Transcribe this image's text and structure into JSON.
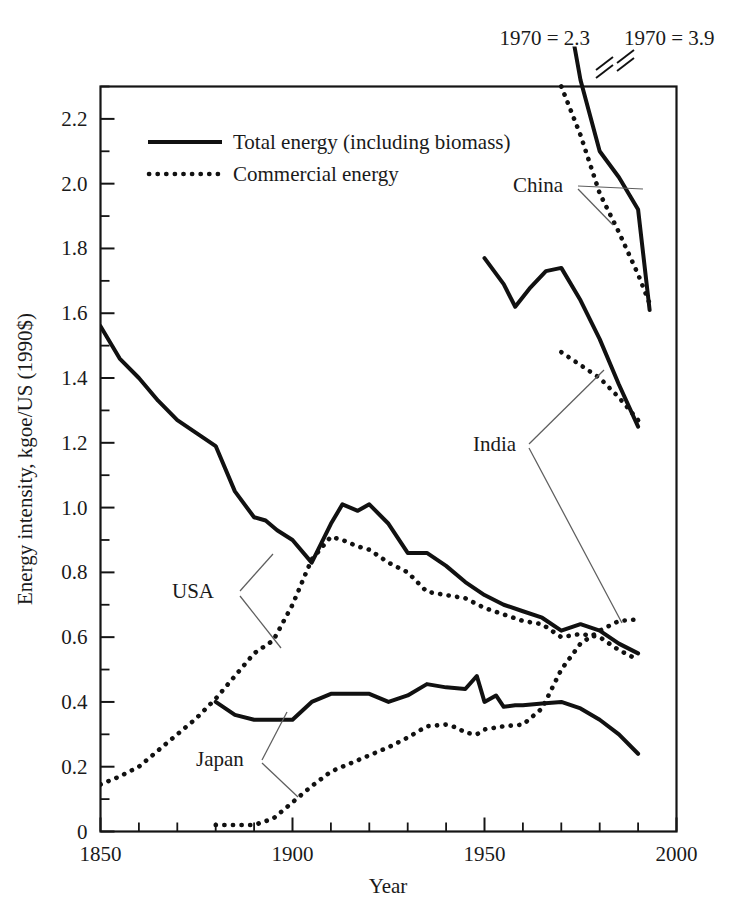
{
  "chart_data": {
    "type": "line",
    "title": "",
    "xlabel": "Year",
    "ylabel": "Energy intensity, kgoe/US (1990$)",
    "xlim": [
      1850,
      2000
    ],
    "ylim": [
      0,
      2.3
    ],
    "xticks": [
      1850,
      1900,
      1950,
      2000
    ],
    "xtick_labels": [
      "1850",
      "1900",
      "1950",
      "2000"
    ],
    "x_minor_step": 10,
    "yticks": [
      0,
      0.2,
      0.4,
      0.6,
      0.8,
      1.0,
      1.2,
      1.4,
      1.6,
      1.8,
      2.0,
      2.2
    ],
    "ytick_labels": [
      "0",
      "0.2",
      "0.4",
      "0.6",
      "0.8",
      "1.0",
      "1.2",
      "1.4",
      "1.6",
      "1.8",
      "2.0",
      "2.2"
    ],
    "y_minor_step": 0.1,
    "grid": false,
    "legend_position": "upper-left-inside",
    "legend": [
      {
        "label": "Total energy (including biomass)",
        "style": "solid"
      },
      {
        "label": "Commercial energy",
        "style": "dotted"
      }
    ],
    "annotations": [
      {
        "text": "1970 = 2.3",
        "series": "China commercial energy",
        "note": "off-scale value above plot, axis break"
      },
      {
        "text": "1970 = 3.9",
        "series": "China total energy",
        "note": "off-scale value above plot, axis break"
      }
    ],
    "country_labels": [
      "USA",
      "Japan",
      "China",
      "India"
    ],
    "series": [
      {
        "name": "USA total energy (including biomass)",
        "country": "USA",
        "style": "solid",
        "x": [
          1850,
          1855,
          1860,
          1865,
          1870,
          1875,
          1880,
          1885,
          1890,
          1893,
          1896,
          1900,
          1905,
          1910,
          1913,
          1917,
          1920,
          1925,
          1930,
          1935,
          1940,
          1945,
          1950,
          1955,
          1960,
          1965,
          1970,
          1975,
          1980,
          1985,
          1990
        ],
        "y": [
          1.56,
          1.46,
          1.4,
          1.33,
          1.27,
          1.23,
          1.19,
          1.05,
          0.97,
          0.96,
          0.93,
          0.9,
          0.83,
          0.95,
          1.01,
          0.99,
          1.01,
          0.95,
          0.86,
          0.86,
          0.82,
          0.77,
          0.73,
          0.7,
          0.68,
          0.66,
          0.62,
          0.64,
          0.62,
          0.58,
          0.55
        ]
      },
      {
        "name": "USA commercial energy",
        "country": "USA",
        "style": "dotted",
        "x": [
          1850,
          1855,
          1860,
          1865,
          1870,
          1875,
          1880,
          1885,
          1890,
          1895,
          1900,
          1905,
          1910,
          1913,
          1917,
          1920,
          1925,
          1930,
          1935,
          1940,
          1945,
          1950,
          1955,
          1960,
          1965,
          1970,
          1975,
          1980,
          1985,
          1990
        ],
        "y": [
          0.145,
          0.17,
          0.2,
          0.25,
          0.3,
          0.35,
          0.41,
          0.48,
          0.55,
          0.59,
          0.7,
          0.84,
          0.91,
          0.9,
          0.88,
          0.87,
          0.83,
          0.8,
          0.74,
          0.73,
          0.72,
          0.69,
          0.67,
          0.65,
          0.64,
          0.6,
          0.61,
          0.6,
          0.56,
          0.53
        ]
      },
      {
        "name": "Japan total energy (including biomass)",
        "country": "Japan",
        "style": "solid",
        "x": [
          1880,
          1885,
          1890,
          1895,
          1900,
          1905,
          1910,
          1915,
          1920,
          1925,
          1930,
          1935,
          1940,
          1945,
          1948,
          1950,
          1953,
          1955,
          1958,
          1960,
          1965,
          1970,
          1975,
          1980,
          1985,
          1990
        ],
        "y": [
          0.4,
          0.36,
          0.345,
          0.345,
          0.345,
          0.4,
          0.425,
          0.425,
          0.425,
          0.4,
          0.42,
          0.455,
          0.445,
          0.44,
          0.48,
          0.4,
          0.42,
          0.385,
          0.39,
          0.39,
          0.395,
          0.4,
          0.38,
          0.345,
          0.3,
          0.24
        ]
      },
      {
        "name": "Japan commercial energy",
        "country": "Japan",
        "style": "dotted",
        "x": [
          1880,
          1885,
          1890,
          1895,
          1900,
          1905,
          1910,
          1915,
          1920,
          1925,
          1930,
          1935,
          1940,
          1943,
          1945,
          1948,
          1950,
          1955,
          1960,
          1965,
          1970,
          1975,
          1980,
          1985,
          1990
        ],
        "y": [
          0.02,
          0.02,
          0.02,
          0.04,
          0.09,
          0.14,
          0.185,
          0.21,
          0.235,
          0.26,
          0.29,
          0.325,
          0.33,
          0.32,
          0.305,
          0.3,
          0.315,
          0.325,
          0.33,
          0.38,
          0.5,
          0.58,
          0.62,
          0.65,
          0.655
        ]
      },
      {
        "name": "India total energy (including biomass)",
        "country": "India",
        "style": "solid",
        "x": [
          1950,
          1955,
          1958,
          1962,
          1966,
          1970,
          1975,
          1980,
          1985,
          1990
        ],
        "y": [
          1.77,
          1.69,
          1.62,
          1.68,
          1.73,
          1.74,
          1.64,
          1.52,
          1.38,
          1.25
        ]
      },
      {
        "name": "India commercial energy",
        "country": "India",
        "style": "dotted",
        "x": [
          1970,
          1975,
          1980,
          1985,
          1990
        ],
        "y": [
          1.48,
          1.44,
          1.4,
          1.34,
          1.27
        ]
      },
      {
        "name": "China total energy (including biomass)",
        "country": "China",
        "style": "solid",
        "x": [
          1970,
          1975,
          1980,
          1985,
          1990,
          1993
        ],
        "y": [
          3.9,
          2.32,
          2.1,
          2.02,
          1.92,
          1.61
        ],
        "note": "1970 value 3.9 is off-scale, shown with axis break"
      },
      {
        "name": "China commercial energy",
        "country": "China",
        "style": "dotted",
        "x": [
          1970,
          1975,
          1980,
          1985,
          1990,
          1993
        ],
        "y": [
          2.3,
          2.15,
          1.97,
          1.85,
          1.72,
          1.63
        ],
        "note": "1970 value 2.3 is off-scale, shown with axis break"
      }
    ]
  },
  "axis": {
    "x_title": "Year",
    "y_title": "Energy intensity, kgoe/US (1990$)",
    "x_ticks": [
      "1850",
      "1900",
      "1950",
      "2000"
    ],
    "y_ticks": [
      "0",
      "0.2",
      "0.4",
      "0.6",
      "0.8",
      "1.0",
      "1.2",
      "1.4",
      "1.6",
      "1.8",
      "2.0",
      "2.2"
    ]
  },
  "legend": {
    "total_label": "Total energy (including biomass)",
    "commercial_label": "Commercial energy"
  },
  "annotations": {
    "china_commercial": "1970 = 2.3",
    "china_total": "1970 = 3.9"
  },
  "labels": {
    "usa": "USA",
    "japan": "Japan",
    "china": "China",
    "india": "India"
  },
  "colors": {
    "ink": "#111111",
    "leader": "#5e5e5e",
    "background": "#ffffff"
  }
}
